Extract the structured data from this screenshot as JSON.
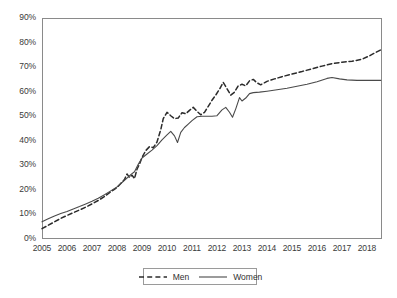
{
  "chart_data": {
    "type": "line",
    "title": "",
    "subtitle": "",
    "xlabel": "",
    "ylabel": "",
    "xlim": [
      2005,
      2018.6
    ],
    "ylim": [
      0,
      90
    ],
    "grid": true,
    "legend_position": "bottom",
    "y_ticks": [
      "0%",
      "10%",
      "20%",
      "30%",
      "40%",
      "50%",
      "60%",
      "70%",
      "80%",
      "90%"
    ],
    "y_tick_values": [
      0,
      10,
      20,
      30,
      40,
      50,
      60,
      70,
      80,
      90
    ],
    "x_ticks": [
      "2005",
      "2006",
      "2007",
      "2008",
      "2009",
      "2010",
      "2011",
      "2012",
      "2013",
      "2014",
      "2015",
      "2016",
      "2017",
      "2018"
    ],
    "x_tick_values": [
      2005,
      2006,
      2007,
      2008,
      2009,
      2010,
      2011,
      2012,
      2013,
      2014,
      2015,
      2016,
      2017,
      2018
    ],
    "series": [
      {
        "name": "Men",
        "style": "dashed",
        "color": "#2b2b2b",
        "points": [
          [
            2005.0,
            4.2
          ],
          [
            2005.25,
            5.6
          ],
          [
            2005.5,
            7.0
          ],
          [
            2005.75,
            8.4
          ],
          [
            2006.0,
            9.6
          ],
          [
            2006.25,
            10.7
          ],
          [
            2006.5,
            11.8
          ],
          [
            2006.75,
            13.0
          ],
          [
            2007.0,
            14.3
          ],
          [
            2007.25,
            15.7
          ],
          [
            2007.5,
            17.3
          ],
          [
            2007.75,
            19.2
          ],
          [
            2008.0,
            21.0
          ],
          [
            2008.15,
            22.6
          ],
          [
            2008.3,
            24.2
          ],
          [
            2008.4,
            26.5
          ],
          [
            2008.5,
            25.0
          ],
          [
            2008.6,
            26.0
          ],
          [
            2008.7,
            24.6
          ],
          [
            2008.8,
            28.4
          ],
          [
            2008.9,
            30.5
          ],
          [
            2009.0,
            33.2
          ],
          [
            2009.15,
            36.0
          ],
          [
            2009.3,
            37.6
          ],
          [
            2009.45,
            37.2
          ],
          [
            2009.6,
            39.5
          ],
          [
            2009.75,
            44.5
          ],
          [
            2009.85,
            49.0
          ],
          [
            2010.0,
            51.6
          ],
          [
            2010.15,
            50.2
          ],
          [
            2010.3,
            49.0
          ],
          [
            2010.45,
            49.3
          ],
          [
            2010.6,
            51.4
          ],
          [
            2010.75,
            51.0
          ],
          [
            2010.9,
            52.4
          ],
          [
            2011.05,
            53.6
          ],
          [
            2011.2,
            52.0
          ],
          [
            2011.35,
            50.6
          ],
          [
            2011.5,
            51.6
          ],
          [
            2011.65,
            54.0
          ],
          [
            2011.8,
            56.5
          ],
          [
            2011.95,
            58.6
          ],
          [
            2012.1,
            61.0
          ],
          [
            2012.25,
            63.8
          ],
          [
            2012.4,
            61.2
          ],
          [
            2012.55,
            58.6
          ],
          [
            2012.7,
            59.8
          ],
          [
            2012.85,
            62.4
          ],
          [
            2013.0,
            63.0
          ],
          [
            2013.15,
            62.4
          ],
          [
            2013.3,
            64.4
          ],
          [
            2013.45,
            65.0
          ],
          [
            2013.6,
            63.6
          ],
          [
            2013.75,
            62.8
          ],
          [
            2014.0,
            64.2
          ],
          [
            2014.3,
            65.2
          ],
          [
            2014.6,
            66.1
          ],
          [
            2015.0,
            67.2
          ],
          [
            2015.4,
            68.2
          ],
          [
            2015.8,
            69.3
          ],
          [
            2016.2,
            70.4
          ],
          [
            2016.6,
            71.4
          ],
          [
            2017.0,
            72.0
          ],
          [
            2017.4,
            72.4
          ],
          [
            2017.8,
            73.2
          ],
          [
            2018.1,
            74.6
          ],
          [
            2018.35,
            76.0
          ],
          [
            2018.55,
            77.0
          ]
        ]
      },
      {
        "name": "Women",
        "style": "solid",
        "color": "#4a4a4a",
        "points": [
          [
            2005.0,
            7.0
          ],
          [
            2005.25,
            8.2
          ],
          [
            2005.5,
            9.4
          ],
          [
            2005.75,
            10.4
          ],
          [
            2006.0,
            11.2
          ],
          [
            2006.25,
            12.2
          ],
          [
            2006.5,
            13.2
          ],
          [
            2006.75,
            14.3
          ],
          [
            2007.0,
            15.4
          ],
          [
            2007.25,
            16.6
          ],
          [
            2007.5,
            18.0
          ],
          [
            2007.75,
            19.6
          ],
          [
            2008.0,
            21.2
          ],
          [
            2008.2,
            23.0
          ],
          [
            2008.4,
            24.8
          ],
          [
            2008.55,
            26.2
          ],
          [
            2008.7,
            27.4
          ],
          [
            2008.85,
            30.4
          ],
          [
            2009.0,
            33.0
          ],
          [
            2009.2,
            34.6
          ],
          [
            2009.4,
            36.2
          ],
          [
            2009.6,
            38.0
          ],
          [
            2009.8,
            40.4
          ],
          [
            2010.0,
            42.4
          ],
          [
            2010.15,
            43.8
          ],
          [
            2010.3,
            42.0
          ],
          [
            2010.42,
            39.3
          ],
          [
            2010.55,
            43.4
          ],
          [
            2010.7,
            45.4
          ],
          [
            2010.85,
            46.8
          ],
          [
            2011.0,
            48.2
          ],
          [
            2011.2,
            49.8
          ],
          [
            2011.4,
            50.0
          ],
          [
            2011.6,
            50.0
          ],
          [
            2011.8,
            50.0
          ],
          [
            2012.0,
            50.2
          ],
          [
            2012.2,
            52.6
          ],
          [
            2012.35,
            53.6
          ],
          [
            2012.5,
            51.6
          ],
          [
            2012.62,
            49.6
          ],
          [
            2012.75,
            53.0
          ],
          [
            2012.9,
            57.6
          ],
          [
            2013.0,
            56.2
          ],
          [
            2013.15,
            57.4
          ],
          [
            2013.3,
            59.2
          ],
          [
            2013.45,
            59.6
          ],
          [
            2013.7,
            59.8
          ],
          [
            2014.0,
            60.2
          ],
          [
            2014.4,
            60.8
          ],
          [
            2014.8,
            61.4
          ],
          [
            2015.2,
            62.2
          ],
          [
            2015.6,
            63.0
          ],
          [
            2016.0,
            64.0
          ],
          [
            2016.4,
            65.4
          ],
          [
            2016.6,
            65.8
          ],
          [
            2016.9,
            65.2
          ],
          [
            2017.2,
            64.8
          ],
          [
            2017.6,
            64.6
          ],
          [
            2018.0,
            64.6
          ],
          [
            2018.55,
            64.6
          ]
        ]
      }
    ]
  },
  "legend": {
    "items": [
      {
        "label": "Men"
      },
      {
        "label": "Women"
      }
    ]
  }
}
